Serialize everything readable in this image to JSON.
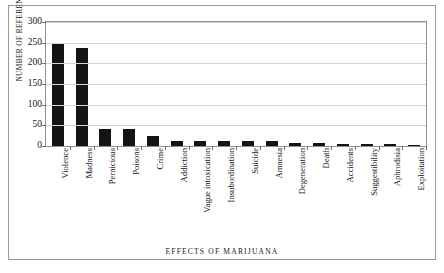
{
  "chart_data": {
    "type": "bar",
    "title": "",
    "xlabel": "EFFECTS OF MARIJUANA",
    "ylabel": "NUMBER OF REFERENCES",
    "categories": [
      "Violence",
      "Madness",
      "Pernicious",
      "Poisons",
      "Crime",
      "Addiction",
      "Vague intoxication",
      "Insubordination",
      "Suicide",
      "Amnesia",
      "Degeneration",
      "Death",
      "Accidents",
      "Suggestibility",
      "Aphrodisia",
      "Exploitation"
    ],
    "values": [
      247,
      236,
      42,
      40,
      25,
      13,
      12,
      12,
      11,
      11,
      8,
      7,
      5,
      4,
      4,
      3
    ],
    "ylim": [
      0,
      300
    ],
    "yticks": [
      0,
      50,
      100,
      150,
      200,
      250,
      300
    ],
    "ytick_labels": [
      "0",
      "50",
      "100",
      "150",
      "200",
      "250",
      "300"
    ],
    "grid": true,
    "legend": "none",
    "bar_color": "#141414",
    "grid_color": "#d3d3d3",
    "axis_color": "#8f8f8f",
    "background": "#ffffff"
  }
}
